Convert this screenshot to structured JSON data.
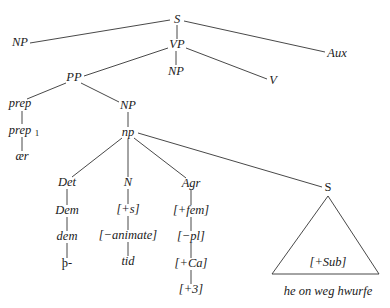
{
  "diagram": {
    "type": "syntax-tree",
    "nodes": {
      "S_root": {
        "label": "S",
        "x": 177,
        "y": 20
      },
      "NP_subj": {
        "label": "NP",
        "x": 20,
        "y": 43
      },
      "VP": {
        "label": "VP",
        "x": 177,
        "y": 45
      },
      "Aux": {
        "label": "Aux",
        "x": 337,
        "y": 54
      },
      "PP": {
        "label": "PP",
        "x": 74,
        "y": 78
      },
      "NP_obj": {
        "label": "NP",
        "x": 176,
        "y": 72
      },
      "V": {
        "label": "V",
        "x": 273,
        "y": 81
      },
      "prep": {
        "label": "prep",
        "x": 20,
        "y": 104
      },
      "NP_pp": {
        "label": "NP",
        "x": 128,
        "y": 106
      },
      "prep1": {
        "label": "prep",
        "sub": "1",
        "x": 22,
        "y": 131
      },
      "np": {
        "label": "np",
        "x": 128,
        "y": 133
      },
      "aer": {
        "label": "ær",
        "x": 22,
        "y": 157
      },
      "Det": {
        "label": "Det",
        "x": 67,
        "y": 183
      },
      "N": {
        "label": "N",
        "x": 128,
        "y": 183
      },
      "Agr": {
        "label": "Agr",
        "x": 191,
        "y": 184
      },
      "S_sub": {
        "label": "S",
        "x": 328,
        "y": 188
      },
      "Dem": {
        "label": "Dem",
        "x": 67,
        "y": 211
      },
      "plus_s": {
        "label": "[+s]",
        "x": 128,
        "y": 210
      },
      "plus_fem": {
        "label": "[+fem]",
        "x": 191,
        "y": 211
      },
      "dem": {
        "label": "dem",
        "x": 67,
        "y": 237
      },
      "minus_animate": {
        "label": "[−animate]",
        "x": 128,
        "y": 236
      },
      "minus_pl": {
        "label": "[−pl]",
        "x": 191,
        "y": 237
      },
      "thorn": {
        "label": "þ-",
        "x": 67,
        "y": 264
      },
      "tid": {
        "label": "tid",
        "x": 128,
        "y": 262
      },
      "plus_Ca": {
        "label": "[+Ca]",
        "x": 191,
        "y": 264
      },
      "plus_3": {
        "label": "[+3]",
        "x": 191,
        "y": 290
      },
      "plus_Sub": {
        "label": "[+Sub]",
        "x": 328,
        "y": 263
      },
      "clause_text": {
        "label": "he on weg hwurfe",
        "x": 328,
        "y": 292
      }
    },
    "edges": [
      [
        "S_root",
        "NP_subj"
      ],
      [
        "S_root",
        "VP"
      ],
      [
        "S_root",
        "Aux"
      ],
      [
        "VP",
        "PP"
      ],
      [
        "VP",
        "NP_obj"
      ],
      [
        "VP",
        "V"
      ],
      [
        "PP",
        "prep"
      ],
      [
        "PP",
        "NP_pp"
      ],
      [
        "prep",
        "prep1"
      ],
      [
        "prep1",
        "aer"
      ],
      [
        "NP_pp",
        "np"
      ],
      [
        "np",
        "Det"
      ],
      [
        "np",
        "N"
      ],
      [
        "np",
        "Agr"
      ],
      [
        "np",
        "S_sub"
      ],
      [
        "Det",
        "Dem"
      ],
      [
        "Dem",
        "dem"
      ],
      [
        "dem",
        "thorn"
      ],
      [
        "N",
        "plus_s"
      ],
      [
        "plus_s",
        "minus_animate"
      ],
      [
        "minus_animate",
        "tid"
      ],
      [
        "Agr",
        "plus_fem"
      ],
      [
        "plus_fem",
        "minus_pl"
      ],
      [
        "minus_pl",
        "plus_Ca"
      ],
      [
        "plus_Ca",
        "plus_3"
      ]
    ],
    "triangle": {
      "apex": [
        328,
        196
      ],
      "base_left": [
        272,
        274
      ],
      "base_right": [
        379,
        274
      ]
    }
  }
}
